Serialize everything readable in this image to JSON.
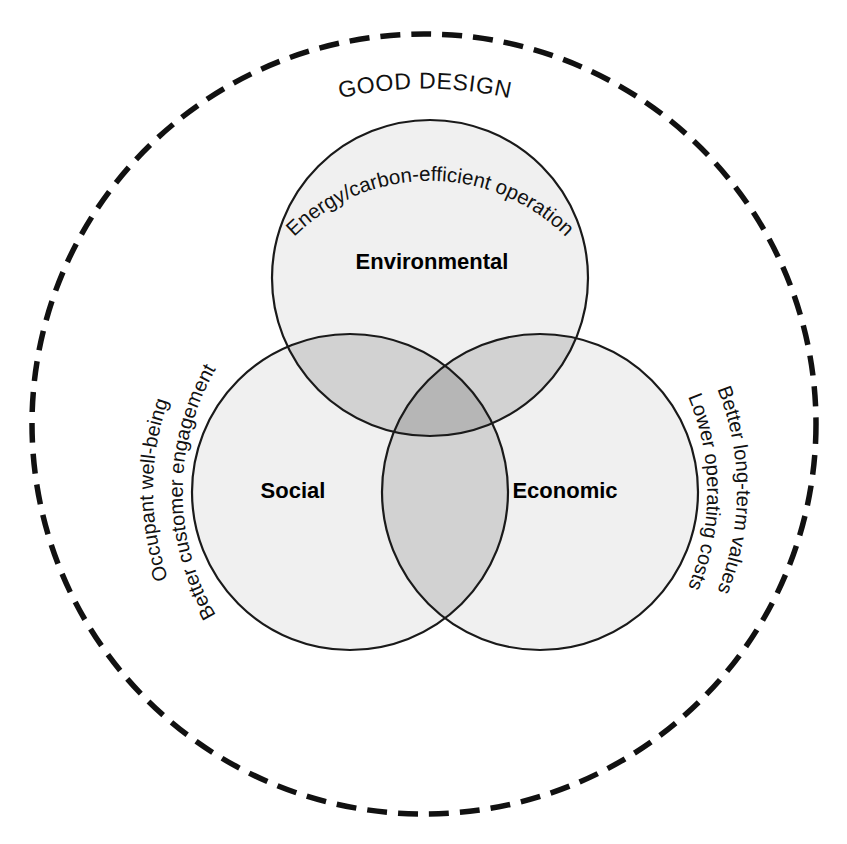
{
  "diagram": {
    "title": "GOOD DESIGN",
    "type": "three-set-venn-with-enclosing-boundary",
    "colors": {
      "circle_fill": "#f0f0f0",
      "pair_overlap_fill": "#d2d2d2",
      "triple_overlap_fill": "#b6b6b6",
      "outline": "#1a1a1a",
      "boundary": "#111111",
      "text": "#111111",
      "background": "#ffffff"
    },
    "outer_boundary": {
      "name": "good-design-boundary",
      "style": "dashed",
      "label": "GOOD DESIGN"
    },
    "sets": [
      {
        "id": "environmental",
        "label": "Environmental",
        "position": "top",
        "benefits": [
          "Energy/carbon-efficient operation"
        ]
      },
      {
        "id": "social",
        "label": "Social",
        "position": "bottom-left",
        "benefits": [
          "Occupant well-being",
          "Better customer engagement"
        ]
      },
      {
        "id": "economic",
        "label": "Economic",
        "position": "bottom-right",
        "benefits": [
          "Better long-term values",
          "Lower operating costs"
        ]
      }
    ],
    "curved_labels": {
      "top": "Energy/carbon-efficient operation",
      "left_outer": "Occupant well-being",
      "left_inner": "Better customer engagement",
      "right_outer": "Better long-term values",
      "right_inner": "Lower operating costs"
    }
  }
}
